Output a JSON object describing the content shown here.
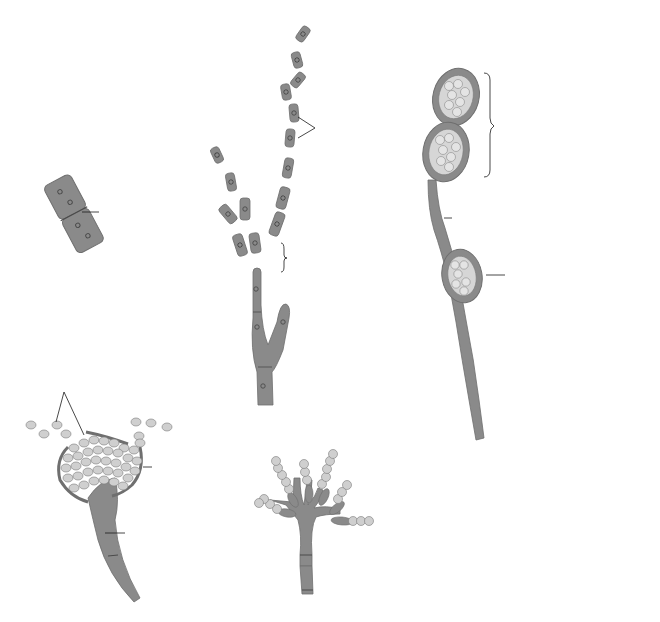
{
  "figure": {
    "colors": {
      "hypha_fill": "#8a8a8a",
      "hypha_stroke": "#6f6f6f",
      "spore_fill": "#cfcfcf",
      "spore_stroke": "#7a7a7a",
      "nucleus_stroke": "#4a4a4a",
      "text": "#1a1a1a",
      "background": "#ffffff"
    },
    "panels": {
      "a": {
        "tag": "(a)",
        "labels": {
          "fissure": "Transverse\nfissure forming\nnew cell wall"
        }
      },
      "b": {
        "tag": "(b)",
        "labels": {
          "arthroconidia": "Arthroconidia\n(arthrospores)",
          "fragmenting": "Fragmenting hypha"
        }
      },
      "c": {
        "tag": "(c)",
        "labels": {
          "terminal": "Terminal\nchlamydospores",
          "within": "Chlamydospore within a hypha"
        }
      },
      "d": {
        "tag": "(d)",
        "labels": {
          "sporangiospores": "Sporangiospores",
          "sporangium": "Sporangium",
          "sporangiophore": "Sporangiophore"
        }
      },
      "e": {
        "tag": "(e)",
        "labels": {
          "conidiospores": "Conidiospores",
          "conidiophore": "Conidiophore"
        }
      },
      "f": {
        "tag": "(f)",
        "labels": {
          "blastospores": "Blastospores",
          "mother_cell": "Vegetative\nmother\ncell"
        }
      }
    }
  }
}
